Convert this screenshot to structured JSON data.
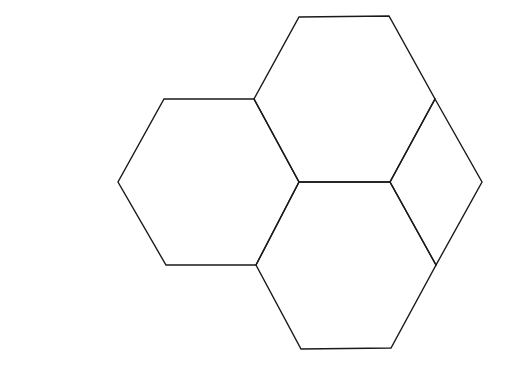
{
  "diagram": {
    "stroke_color": "#1a1a1a",
    "background_color": "#ffffff",
    "shapes": [
      {
        "id": "hexagon-left",
        "type": "hexagon",
        "points": "164,99 254,99 299,182 256,265 166,265 118,182"
      },
      {
        "id": "hexagon-top",
        "type": "hexagon",
        "points": "299,17 389,16 435,99 390,182 299,182 254,99"
      },
      {
        "id": "hexagon-bottom",
        "type": "hexagon",
        "points": "299,182 390,182 436,265 391,348 301,349 256,265"
      },
      {
        "id": "rhombus-right",
        "type": "rhombus",
        "points": "435,99 482,182 436,265 390,182"
      }
    ]
  }
}
